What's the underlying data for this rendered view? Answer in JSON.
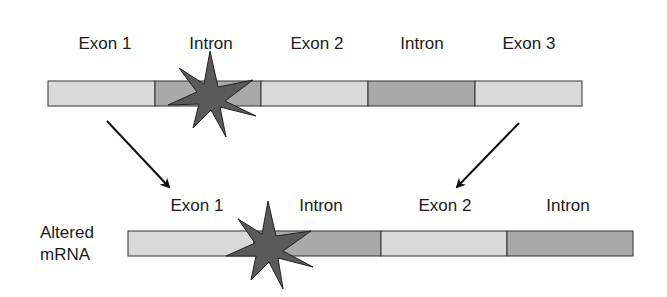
{
  "colors": {
    "exon": "#d9d9d9",
    "intron": "#a9a9a9",
    "outline": "#333333",
    "star": "#5a5a5a",
    "arrow": "#111111"
  },
  "gene": {
    "segments": [
      {
        "type": "exon",
        "label": "Exon 1"
      },
      {
        "type": "intron",
        "label": "Intron"
      },
      {
        "type": "exon",
        "label": "Exon 2"
      },
      {
        "type": "intron",
        "label": "Intron"
      },
      {
        "type": "exon",
        "label": "Exon 3"
      }
    ],
    "mutation": "star on intron 1 splice site"
  },
  "altered_mrna": {
    "side_label_line1": "Altered",
    "side_label_line2": "mRNA",
    "segments": [
      {
        "type": "exon",
        "label": "Exon 1"
      },
      {
        "type": "intron",
        "label": "Intron"
      },
      {
        "type": "exon",
        "label": "Exon 2"
      },
      {
        "type": "intron",
        "label": "Intron"
      }
    ]
  },
  "icons": {
    "mutation": "star-burst-icon",
    "arrow": "arrow-icon"
  }
}
